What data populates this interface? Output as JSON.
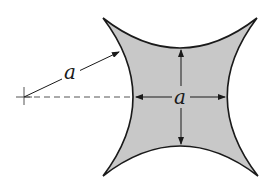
{
  "diagram": {
    "shape": {
      "name": "concave-square",
      "fill_color": "#c8c8c8",
      "stroke_color": "#1a1a1a"
    },
    "labels": {
      "radius_label": "a",
      "width_label": "a"
    },
    "center_marker": {
      "name": "center-of-curvature"
    },
    "colors": {
      "line": "#1a1a1a",
      "dashed": "#555555"
    }
  }
}
